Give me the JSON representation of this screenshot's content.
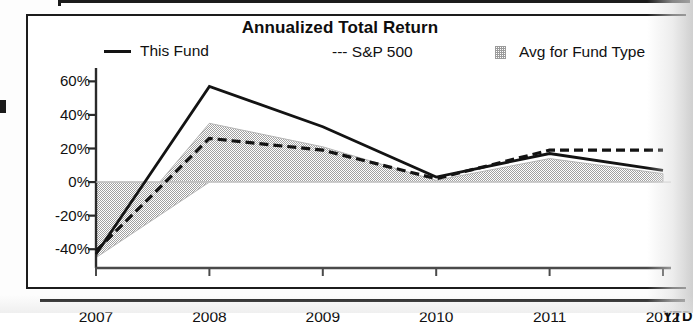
{
  "chart_data": {
    "type": "line",
    "title": "Annualized Total Return",
    "xlabel": "",
    "ylabel": "",
    "x": [
      "2007",
      "2008",
      "2009",
      "2010",
      "2011",
      "2012"
    ],
    "x_axis_suffix": "YTD",
    "ylim": [
      -50,
      62
    ],
    "yticks": [
      60,
      40,
      20,
      0,
      -20,
      -40
    ],
    "ytick_labels": [
      "60%",
      "40%",
      "20%",
      "0%",
      "-20%",
      "-40%"
    ],
    "grid": false,
    "legend_position": "top",
    "series": [
      {
        "name": "This Fund",
        "style": "solid",
        "color": "#131313",
        "values": [
          -43,
          57,
          33,
          3,
          17,
          7
        ]
      },
      {
        "name": "S&P 500",
        "style": "dashed",
        "color": "#131313",
        "values": [
          -41,
          26,
          19,
          2,
          19,
          19
        ]
      },
      {
        "name": "Avg for Fund Type",
        "style": "area",
        "color": "#9b9b9b",
        "values": [
          -45,
          35,
          21,
          1,
          14,
          5
        ]
      }
    ]
  },
  "chart": {
    "title": "Annualized Total Return",
    "legend": [
      {
        "key": "this-fund",
        "label": "This Fund",
        "marker": "solid-line-swatch"
      },
      {
        "key": "sp-500",
        "label": "--- S&P 500",
        "marker": "dashed-line-swatch"
      },
      {
        "key": "avg-fund-type",
        "label": "Avg for Fund Type",
        "marker": "area-swatch"
      }
    ],
    "y_axis": {
      "labels": [
        "60%",
        "40%",
        "20%",
        "0%",
        "-20%",
        "-40%"
      ]
    },
    "x_axis": {
      "labels": [
        "2007",
        "2008",
        "2009",
        "2010",
        "2011",
        "2012"
      ],
      "suffix": "YTD"
    }
  }
}
